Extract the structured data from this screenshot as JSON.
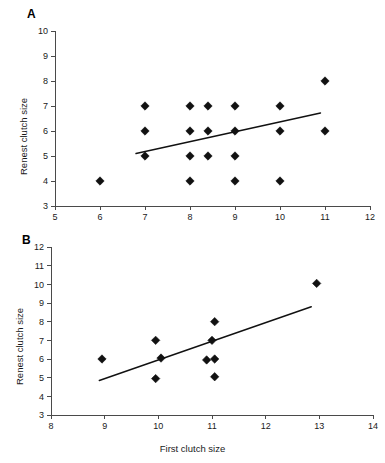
{
  "figure": {
    "panels": [
      {
        "letter": "A",
        "chart_data": {
          "type": "scatter",
          "title": "",
          "xlabel": "",
          "ylabel": "Renest clutch size",
          "xlim": [
            5,
            12
          ],
          "ylim": [
            3,
            10
          ],
          "xticks": [
            5,
            6,
            7,
            8,
            9,
            10,
            11,
            12
          ],
          "yticks": [
            3,
            4,
            5,
            6,
            7,
            8,
            9,
            10
          ],
          "xtick_labels": [
            "5",
            "6",
            "7",
            "8",
            "9",
            "10",
            "11",
            "12"
          ],
          "ytick_labels": [
            "3",
            "4",
            "5",
            "6",
            "7",
            "8",
            "9",
            "10"
          ],
          "grid": false,
          "legend": null,
          "marker": "diamond",
          "points": [
            {
              "x": 6.0,
              "y": 4
            },
            {
              "x": 7.0,
              "y": 7
            },
            {
              "x": 7.0,
              "y": 6
            },
            {
              "x": 7.0,
              "y": 5
            },
            {
              "x": 8.0,
              "y": 7
            },
            {
              "x": 8.0,
              "y": 6
            },
            {
              "x": 8.0,
              "y": 5
            },
            {
              "x": 8.0,
              "y": 4
            },
            {
              "x": 8.4,
              "y": 7
            },
            {
              "x": 8.4,
              "y": 6
            },
            {
              "x": 8.4,
              "y": 5
            },
            {
              "x": 9.0,
              "y": 7
            },
            {
              "x": 9.0,
              "y": 6
            },
            {
              "x": 9.0,
              "y": 5
            },
            {
              "x": 9.0,
              "y": 4
            },
            {
              "x": 10.0,
              "y": 7
            },
            {
              "x": 10.0,
              "y": 6
            },
            {
              "x": 10.0,
              "y": 4
            },
            {
              "x": 11.0,
              "y": 8
            },
            {
              "x": 11.0,
              "y": 6
            }
          ],
          "trend_line": {
            "x1": 6.8,
            "y1": 5.1,
            "x2": 10.9,
            "y2": 6.72
          }
        }
      },
      {
        "letter": "B",
        "chart_data": {
          "type": "scatter",
          "title": "",
          "xlabel": "First clutch size",
          "ylabel": "Renest clutch size",
          "xlim": [
            8,
            14
          ],
          "ylim": [
            3,
            12
          ],
          "xticks": [
            8,
            9,
            10,
            11,
            12,
            13,
            14
          ],
          "yticks": [
            3,
            4,
            5,
            6,
            7,
            8,
            9,
            10,
            11,
            12
          ],
          "xtick_labels": [
            "8",
            "9",
            "10",
            "11",
            "12",
            "13",
            "14"
          ],
          "ytick_labels": [
            "3",
            "4",
            "5",
            "6",
            "7",
            "8",
            "9",
            "10",
            "11",
            "12"
          ],
          "grid": false,
          "legend": null,
          "marker": "diamond",
          "points": [
            {
              "x": 8.95,
              "y": 6.0
            },
            {
              "x": 9.95,
              "y": 7.0
            },
            {
              "x": 10.05,
              "y": 6.05
            },
            {
              "x": 9.95,
              "y": 4.95
            },
            {
              "x": 11.0,
              "y": 7.0
            },
            {
              "x": 11.05,
              "y": 8.0
            },
            {
              "x": 10.9,
              "y": 5.95
            },
            {
              "x": 11.05,
              "y": 6.0
            },
            {
              "x": 11.05,
              "y": 5.05
            },
            {
              "x": 12.95,
              "y": 10.05
            }
          ],
          "trend_line": {
            "x1": 8.9,
            "y1": 4.85,
            "x2": 12.85,
            "y2": 8.8
          }
        }
      }
    ]
  }
}
